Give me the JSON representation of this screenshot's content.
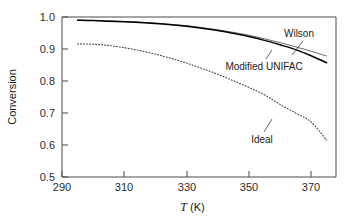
{
  "chart_data": {
    "type": "line",
    "title": "",
    "xlabel": "T (K)",
    "xlabel_symbol": "T",
    "xlabel_units": "(K)",
    "ylabel": "Conversion",
    "xlim": [
      287,
      375
    ],
    "ylim": [
      0.5,
      1.0
    ],
    "xticks": [
      290,
      310,
      330,
      350,
      370
    ],
    "xtick_labels": [
      "290",
      "310",
      "330",
      "350",
      "370"
    ],
    "yticks": [
      0.5,
      0.6,
      0.7,
      0.8,
      0.9,
      1.0
    ],
    "ytick_labels": [
      "0.5",
      "0.6",
      "0.7",
      "0.8",
      "0.9",
      "1.0"
    ],
    "grid": false,
    "legend_position": "inline-annotations",
    "series": [
      {
        "name": "Wilson",
        "style": "solid-thin",
        "color": "#555555",
        "x": [
          292,
          297,
          302,
          307,
          312,
          317,
          322,
          327,
          332,
          337,
          342,
          347,
          352,
          357,
          362,
          367,
          372
        ],
        "values": [
          0.99,
          0.989,
          0.988,
          0.986,
          0.984,
          0.981,
          0.977,
          0.973,
          0.967,
          0.96,
          0.952,
          0.943,
          0.932,
          0.92,
          0.907,
          0.893,
          0.878
        ]
      },
      {
        "name": "Modified UNIFAC",
        "style": "solid-thick",
        "color": "#000000",
        "x": [
          292,
          297,
          302,
          307,
          312,
          317,
          322,
          327,
          332,
          337,
          342,
          347,
          352,
          357,
          362,
          367,
          372
        ],
        "values": [
          0.99,
          0.989,
          0.987,
          0.985,
          0.983,
          0.98,
          0.976,
          0.971,
          0.965,
          0.958,
          0.949,
          0.939,
          0.927,
          0.913,
          0.898,
          0.879,
          0.857
        ]
      },
      {
        "name": "Ideal",
        "style": "dotted",
        "color": "#3c3c3c",
        "x": [
          292,
          297,
          302,
          307,
          312,
          317,
          322,
          327,
          332,
          337,
          342,
          347,
          352,
          357,
          362,
          367,
          372
        ],
        "values": [
          0.916,
          0.915,
          0.911,
          0.904,
          0.895,
          0.884,
          0.871,
          0.856,
          0.839,
          0.821,
          0.801,
          0.78,
          0.757,
          0.727,
          0.7,
          0.672,
          0.615
        ]
      }
    ],
    "annotations": [
      {
        "text": "Wilson",
        "x": 362,
        "y": 0.955
      },
      {
        "text": "Modified UNIFAC",
        "x": 342,
        "y": 0.885
      },
      {
        "text": "Ideal",
        "x": 338,
        "y": 0.665
      }
    ]
  }
}
